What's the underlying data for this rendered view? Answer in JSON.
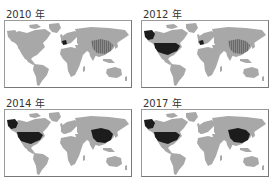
{
  "figure": {
    "panels": [
      {
        "id": "2010",
        "title": "2010 年",
        "highlighted": {
          "france": "dark",
          "china": "medium-hatched",
          "usa": "none",
          "alaska": "none"
        }
      },
      {
        "id": "2012",
        "title": "2012 年",
        "highlighted": {
          "france": "dark",
          "china": "medium-hatched",
          "usa": "dark",
          "alaska": "dark"
        }
      },
      {
        "id": "2014",
        "title": "2014 年",
        "highlighted": {
          "france": "none",
          "china": "dark",
          "usa": "dark",
          "alaska": "dark"
        }
      },
      {
        "id": "2017",
        "title": "2017 年",
        "highlighted": {
          "france": "none",
          "china": "dark",
          "usa": "dark",
          "alaska": "dark"
        }
      }
    ],
    "colors": {
      "land": "#a8a8a8",
      "dark": "#1c1c1c",
      "medium": "#6a6a6a",
      "border": "#9a9a9a"
    }
  }
}
